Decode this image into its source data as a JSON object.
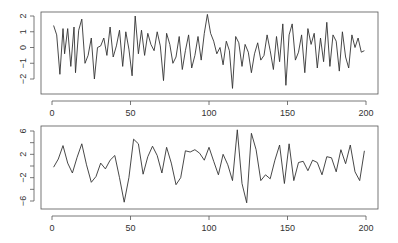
{
  "chart_data": [
    {
      "type": "line",
      "title": "",
      "xlabel": "",
      "ylabel": "",
      "xlim": [
        0,
        200
      ],
      "ylim": [
        -2.6,
        2.2
      ],
      "x_ticks": [
        "0",
        "50",
        "100",
        "150",
        "200"
      ],
      "y_ticks": [
        "-2",
        "-1",
        "0",
        "1",
        "2"
      ],
      "grid": false,
      "color": "#333333",
      "x_keypoints": [
        1,
        3,
        5,
        7,
        8,
        10,
        12,
        14,
        15,
        17,
        19,
        21,
        23,
        25,
        27,
        29,
        31,
        33,
        35,
        37,
        39,
        41,
        43,
        45,
        47,
        49,
        51,
        53,
        55,
        57,
        59,
        61,
        63,
        65,
        67,
        69,
        71,
        73,
        75,
        77,
        79,
        81,
        83,
        85,
        87,
        89,
        91,
        93,
        95,
        97,
        99,
        101,
        103,
        105,
        107,
        109,
        111,
        113,
        115,
        117,
        119,
        121,
        123,
        125,
        127,
        129,
        131,
        133,
        135,
        137,
        139,
        141,
        143,
        145,
        147,
        149,
        151,
        153,
        155,
        157,
        159,
        161,
        163,
        165,
        167,
        169,
        171,
        173,
        175,
        177,
        179,
        181,
        183,
        185,
        187,
        189,
        191,
        193,
        195,
        197,
        199
      ],
      "values": [
        1.4,
        0.8,
        -1.7,
        1.2,
        -0.4,
        1.2,
        -1.2,
        1.3,
        -1.6,
        1.1,
        1.8,
        -1.0,
        -0.5,
        0.6,
        -2.0,
        0.0,
        0.1,
        0.6,
        -0.5,
        1.3,
        -0.6,
        0.1,
        1.1,
        -1.2,
        1.0,
        -0.1,
        -1.8,
        2.0,
        -0.4,
        1.1,
        -0.5,
        0.9,
        0.2,
        -0.2,
        1.0,
        0.1,
        -2.1,
        0.9,
        0.2,
        -1.0,
        -0.6,
        0.7,
        -1.4,
        -0.2,
        0.8,
        -1.3,
        -0.5,
        0.7,
        -0.8,
        0.9,
        2.1,
        0.9,
        0.4,
        -0.4,
        0.0,
        -1.1,
        0.4,
        -0.2,
        -2.6,
        0.7,
        0.3,
        -1.2,
        0.2,
        -0.3,
        -1.6,
        -0.4,
        0.3,
        -0.8,
        -0.5,
        0.8,
        -0.2,
        -1.4,
        0.7,
        -0.9,
        1.5,
        -2.4,
        0.8,
        1.5,
        -0.8,
        -0.3,
        0.8,
        -1.6,
        1.2,
        0.2,
        0.9,
        -1.3,
        0.6,
        -0.9,
        1.6,
        -1.2,
        0.8,
        0.4,
        -1.5,
        1.0,
        -0.6,
        -1.3,
        0.8,
        0.0,
        0.6,
        -0.3,
        -0.2
      ]
    },
    {
      "type": "line",
      "title": "",
      "xlabel": "",
      "ylabel": "",
      "xlim": [
        0,
        200
      ],
      "ylim": [
        -7,
        7
      ],
      "x_ticks": [
        "0",
        "50",
        "100",
        "150",
        "200"
      ],
      "y_ticks": [
        "-6",
        "-2",
        "2",
        "6"
      ],
      "y_minor_ticks": [
        "-4",
        "0",
        "4"
      ],
      "grid": false,
      "color": "#333333",
      "x_keypoints": [
        1,
        4,
        7,
        10,
        13,
        16,
        19,
        22,
        25,
        28,
        31,
        34,
        37,
        40,
        43,
        46,
        49,
        52,
        55,
        58,
        61,
        64,
        67,
        70,
        73,
        76,
        79,
        82,
        85,
        88,
        91,
        94,
        97,
        100,
        103,
        106,
        109,
        112,
        115,
        118,
        121,
        124,
        127,
        130,
        133,
        136,
        139,
        142,
        145,
        148,
        151,
        154,
        157,
        160,
        163,
        166,
        169,
        172,
        175,
        178,
        181,
        184,
        187,
        190,
        193,
        196,
        199
      ],
      "values": [
        -0.2,
        1.2,
        3.5,
        0.5,
        -1.2,
        1.5,
        3.8,
        0.2,
        -2.8,
        -1.8,
        0.5,
        -0.5,
        1.0,
        1.8,
        -2.0,
        -6.2,
        -2.0,
        4.6,
        3.8,
        -1.4,
        1.6,
        3.4,
        1.8,
        -1.2,
        3.2,
        0.5,
        -3.2,
        -2.0,
        2.6,
        2.4,
        2.8,
        2.2,
        1.0,
        3.2,
        0.8,
        -1.5,
        2.0,
        0.2,
        -2.5,
        6.2,
        -3.0,
        -6.3,
        5.6,
        2.8,
        -2.5,
        -1.5,
        -2.2,
        1.0,
        3.6,
        -3.0,
        3.8,
        -2.5,
        0.6,
        0.8,
        -0.8,
        1.0,
        0.6,
        -1.5,
        1.6,
        1.4,
        -1.0,
        2.8,
        0.4,
        3.6,
        -1.0,
        -2.5,
        2.6
      ]
    }
  ]
}
